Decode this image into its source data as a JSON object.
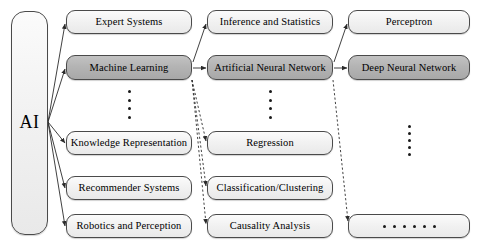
{
  "diagram": {
    "colors": {
      "node_fill": "#f2f2f2",
      "node_fill_highlight": "#b4b4b4",
      "node_border": "#4a4a4a",
      "edge": "#333333",
      "text": "#000000"
    },
    "root": {
      "label": "AI"
    },
    "column1": [
      {
        "label": "Expert Systems",
        "highlight": false
      },
      {
        "label": "Machine Learning",
        "highlight": true
      },
      {
        "label": "Knowledge Representation",
        "highlight": false
      },
      {
        "label": "Recommender Systems",
        "highlight": false
      },
      {
        "label": "Robotics and Perception",
        "highlight": false
      }
    ],
    "column2": [
      {
        "label": "Inference and Statistics",
        "highlight": false
      },
      {
        "label": "Artificial Neural Network",
        "highlight": true
      },
      {
        "label": "Regression",
        "highlight": false
      },
      {
        "label": "Classification/Clustering",
        "highlight": false
      },
      {
        "label": "Causality Analysis",
        "highlight": false
      }
    ],
    "column3": [
      {
        "label": "Perceptron",
        "highlight": false
      },
      {
        "label": "Deep Neural Network",
        "highlight": true
      },
      {
        "label": "",
        "highlight": false
      }
    ],
    "ellipses": {
      "column1_vertical": "⋮",
      "column2_vertical": "⋮",
      "column3_vertical": "⋮",
      "column3_bottom_horizontal": "· · · · · ·"
    }
  }
}
